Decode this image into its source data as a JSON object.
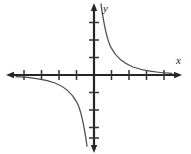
{
  "figure": {
    "title": "",
    "background_color": "#ffffff",
    "width": 191,
    "height": 154
  },
  "axes": {
    "x_label": "x",
    "y_label": "y",
    "axis_color": "#262626",
    "origin_px": {
      "x": 94,
      "y": 75
    },
    "tick_spacing_px": 17.5,
    "tick_half_length_px": 5,
    "x_ticks_left": 4,
    "x_ticks_right": 4,
    "y_ticks_up": 3,
    "y_ticks_down": 4,
    "arrows": [
      "left",
      "right",
      "up",
      "down"
    ],
    "x_range": [
      -5.4,
      5.4
    ],
    "y_range": [
      -4.2,
      4.2
    ],
    "grid": false,
    "tick_labels": []
  },
  "curve": {
    "name": "hyperbola",
    "equation": "y = k / x",
    "k": 1.6,
    "color": "#4d4d4d",
    "stroke_width_px": 1.3,
    "branches": [
      {
        "quadrant": 1,
        "x_from": 0.4,
        "x_to": 5.3
      },
      {
        "quadrant": 3,
        "x_from": -5.3,
        "x_to": -0.4
      }
    ],
    "asymptotes": {
      "vertical": "x = 0",
      "horizontal": "y = 0"
    }
  }
}
